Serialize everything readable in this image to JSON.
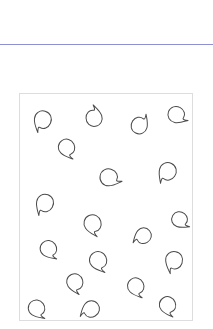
{
  "page": {
    "width": 213,
    "height": 329,
    "background_color": "#ffffff"
  },
  "top_rule": {
    "name": "horizontal-rule",
    "color": "#8f8fd4",
    "x": 0,
    "y": 44,
    "width": 213,
    "height": 1
  },
  "motif_panel": {
    "name": "motif-frame",
    "border_color": "#dddddd",
    "fill_color": "#ffffff",
    "x": 19,
    "y": 93,
    "width": 174,
    "height": 228,
    "motif_stroke_color": "#4a4a4a",
    "motif_stroke_width": 1,
    "motif_shape": "paisley-teardrop-outline",
    "motif_count": 22
  },
  "chart_data": {
    "type": "scatter",
    "title": "",
    "xlabel": "",
    "ylabel": "",
    "xlim": [
      0,
      174
    ],
    "ylim": [
      0,
      228
    ],
    "grid": false,
    "legend": null,
    "series": [
      {
        "name": "paisley-motifs",
        "marker": "paisley-teardrop-outline",
        "points": [
          {
            "id": "m01",
            "x": 22,
            "y": 28,
            "size": 20,
            "rotation": 200
          },
          {
            "id": "m02",
            "x": 75,
            "y": 22,
            "size": 19,
            "rotation": 355
          },
          {
            "id": "m03",
            "x": 122,
            "y": 30,
            "size": 19,
            "rotation": 30
          },
          {
            "id": "m04",
            "x": 160,
            "y": 22,
            "size": 19,
            "rotation": 115
          },
          {
            "id": "m05",
            "x": 48,
            "y": 56,
            "size": 19,
            "rotation": 150
          },
          {
            "id": "m06",
            "x": 92,
            "y": 85,
            "size": 20,
            "rotation": 105
          },
          {
            "id": "m07",
            "x": 148,
            "y": 80,
            "size": 20,
            "rotation": 210
          },
          {
            "id": "m08",
            "x": 24,
            "y": 112,
            "size": 20,
            "rotation": 205
          },
          {
            "id": "m09",
            "x": 74,
            "y": 133,
            "size": 20,
            "rotation": 160
          },
          {
            "id": "m10",
            "x": 123,
            "y": 144,
            "size": 18,
            "rotation": 235
          },
          {
            "id": "m11",
            "x": 163,
            "y": 128,
            "size": 18,
            "rotation": 125
          },
          {
            "id": "m12",
            "x": 30,
            "y": 158,
            "size": 19,
            "rotation": 140
          },
          {
            "id": "m13",
            "x": 80,
            "y": 170,
            "size": 20,
            "rotation": 150
          },
          {
            "id": "m14",
            "x": 155,
            "y": 170,
            "size": 20,
            "rotation": 195
          },
          {
            "id": "m15",
            "x": 56,
            "y": 192,
            "size": 19,
            "rotation": 160
          },
          {
            "id": "m16",
            "x": 118,
            "y": 196,
            "size": 19,
            "rotation": 150
          },
          {
            "id": "m17",
            "x": 18,
            "y": 218,
            "size": 19,
            "rotation": 140
          },
          {
            "id": "m18",
            "x": 70,
            "y": 218,
            "size": 19,
            "rotation": 235
          },
          {
            "id": "m19",
            "x": 150,
            "y": 215,
            "size": 19,
            "rotation": 155
          },
          {
            "id": "m20",
            "x": 48,
            "y": 270,
            "size": 19,
            "rotation": 140
          },
          {
            "id": "m21",
            "x": 100,
            "y": 282,
            "size": 19,
            "rotation": 215
          },
          {
            "id": "m22",
            "x": 157,
            "y": 268,
            "size": 19,
            "rotation": 155
          }
        ]
      }
    ]
  }
}
